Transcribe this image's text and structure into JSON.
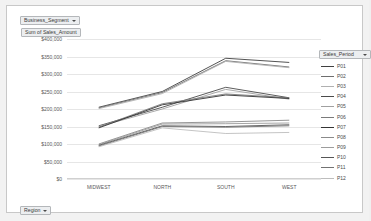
{
  "filters": {
    "segment": {
      "label": "Business_Segment",
      "icon": "filter-caret-icon"
    },
    "region": {
      "label": "Region",
      "icon": "filter-caret-icon"
    }
  },
  "value_field": {
    "label": "Sum of Sales_Amount"
  },
  "legend": {
    "title": "Sales_Period",
    "icon": "legend-caret-icon"
  },
  "chart_data": {
    "type": "line",
    "title": "Sum of Sales_Amount",
    "xlabel": "",
    "ylabel": "",
    "categories": [
      "MIDWEST",
      "NORTH",
      "SOUTH",
      "WEST"
    ],
    "ylim": [
      0,
      400000
    ],
    "yticks": [
      0,
      50000,
      100000,
      150000,
      200000,
      250000,
      300000,
      350000,
      400000
    ],
    "ytick_labels": [
      "$0",
      "$50,000",
      "$100,000",
      "$150,000",
      "$200,000",
      "$250,000",
      "$300,000",
      "$350,000",
      "$400,000"
    ],
    "grid": true,
    "legend_position": "right",
    "legend_title": "Sales_Period",
    "series": [
      {
        "name": "P01",
        "color": "#404040",
        "values": [
          205000,
          250000,
          345000,
          333000
        ]
      },
      {
        "name": "P02",
        "color": "#6e6e6e",
        "values": [
          203000,
          247000,
          338000,
          320000
        ]
      },
      {
        "name": "P03",
        "color": "#b0b0b0",
        "values": [
          201000,
          244000,
          336000,
          318000
        ]
      },
      {
        "name": "P04",
        "color": "#4a4a4a",
        "values": [
          152000,
          205000,
          262000,
          232000
        ]
      },
      {
        "name": "P05",
        "color": "#a0a0a0",
        "values": [
          150000,
          200000,
          256000,
          228000
        ]
      },
      {
        "name": "P06",
        "color": "#7a7a7a",
        "values": [
          148000,
          215000,
          243000,
          232000
        ]
      },
      {
        "name": "P07",
        "color": "#333333",
        "values": [
          146000,
          212000,
          240000,
          230000
        ]
      },
      {
        "name": "P08",
        "color": "#8a8a8a",
        "values": [
          100000,
          160000,
          163000,
          168000
        ]
      },
      {
        "name": "P09",
        "color": "#9c9c9c",
        "values": [
          98000,
          157000,
          158000,
          160000
        ]
      },
      {
        "name": "P10",
        "color": "#555555",
        "values": [
          96000,
          152000,
          150000,
          155000
        ]
      },
      {
        "name": "P11",
        "color": "#727272",
        "values": [
          94000,
          150000,
          148000,
          152000
        ]
      },
      {
        "name": "P12",
        "color": "#bdbdbd",
        "values": [
          92000,
          146000,
          130000,
          133000
        ]
      }
    ]
  }
}
